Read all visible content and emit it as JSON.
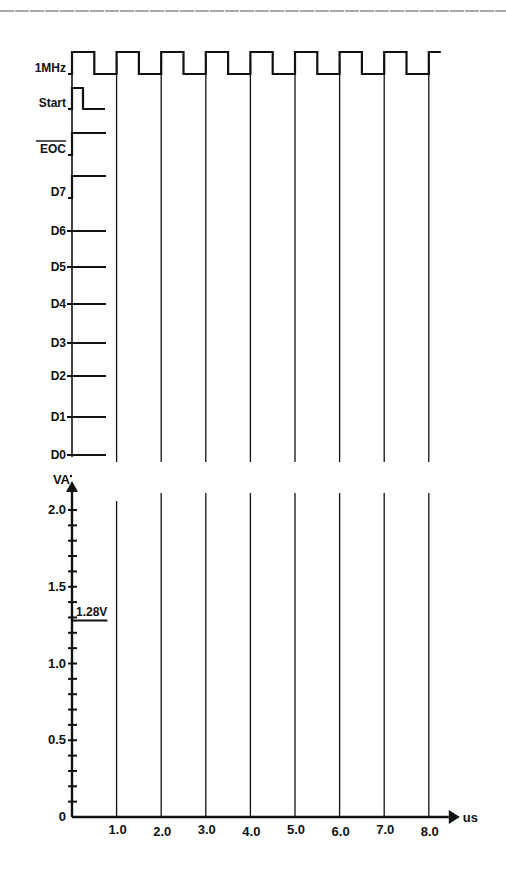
{
  "colors": {
    "line": "#111111",
    "grid": "#222222",
    "top_rule": "#555555",
    "background": "#ffffff"
  },
  "timing": {
    "signals": [
      {
        "name": "1MHz",
        "y_high": 52,
        "y_low": 74,
        "type": "clock"
      },
      {
        "name": "Start",
        "y_high": 88,
        "y_low": 109,
        "type": "pulse"
      },
      {
        "name": "EOC",
        "overbar": true,
        "y_high": 133,
        "y_low": 155,
        "type": "step-high"
      },
      {
        "name": "D7",
        "y_high": 176,
        "y_low": 198,
        "type": "step-high"
      },
      {
        "name": "D6",
        "y": 231,
        "type": "flat"
      },
      {
        "name": "D5",
        "y": 267,
        "type": "flat"
      },
      {
        "name": "D4",
        "y": 304,
        "type": "flat"
      },
      {
        "name": "D3",
        "y": 343,
        "type": "flat"
      },
      {
        "name": "D2",
        "y": 376,
        "type": "flat"
      },
      {
        "name": "D1",
        "y": 417,
        "type": "flat"
      },
      {
        "name": "D0",
        "y": 455,
        "type": "flat"
      }
    ]
  },
  "chart_data": {
    "type": "line",
    "title": "",
    "xlabel": "us",
    "ylabel": "VA",
    "x_ticks": [
      "1.0",
      "2.0",
      "3.0",
      "4.0",
      "5.0",
      "6.0",
      "7.0",
      "8.0"
    ],
    "y_ticks": [
      "0",
      "0.5",
      "1.0",
      "1.5",
      "2.0"
    ],
    "y_minor_step": 0.1,
    "xlim": [
      0,
      8.0
    ],
    "ylim": [
      0,
      2.0
    ],
    "annotations": [
      {
        "text": "1.28V",
        "x": 0.0,
        "y": 1.28,
        "segment_x_end": 0.75
      }
    ],
    "series": [
      {
        "name": "VA",
        "x": [
          0.0,
          0.75
        ],
        "y": [
          1.28,
          1.28
        ]
      }
    ],
    "grid": {
      "vertical_lines_at": [
        1,
        2,
        3,
        4,
        5,
        6,
        7,
        8
      ]
    }
  }
}
